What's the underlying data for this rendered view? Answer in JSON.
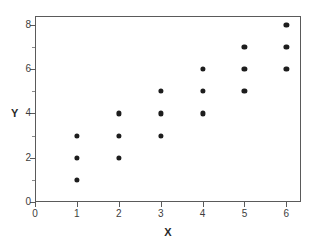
{
  "chart_data": {
    "type": "scatter",
    "title": "",
    "xlabel": "X",
    "ylabel": "Y",
    "xlim": [
      0,
      6.35
    ],
    "ylim": [
      0,
      8.4
    ],
    "grid": false,
    "legend": null,
    "x_ticks": [
      0,
      1,
      2,
      3,
      4,
      5,
      6
    ],
    "x_tick_labels": [
      "0",
      "1",
      "2",
      "3",
      "4",
      "5",
      "6"
    ],
    "y_ticks": [
      0,
      2,
      4,
      6,
      8
    ],
    "y_tick_labels": [
      "0",
      "2",
      "4",
      "6",
      "8"
    ],
    "y_minor_ticks": [
      1,
      3,
      5,
      7
    ],
    "marker": "filled-circle",
    "marker_color": "#1d1d1d",
    "points": [
      {
        "x": 1,
        "y": 1
      },
      {
        "x": 1,
        "y": 2
      },
      {
        "x": 1,
        "y": 3
      },
      {
        "x": 2,
        "y": 2
      },
      {
        "x": 2,
        "y": 3
      },
      {
        "x": 2,
        "y": 4
      },
      {
        "x": 3,
        "y": 3
      },
      {
        "x": 3,
        "y": 4
      },
      {
        "x": 3,
        "y": 5
      },
      {
        "x": 4,
        "y": 4
      },
      {
        "x": 4,
        "y": 5
      },
      {
        "x": 4,
        "y": 6
      },
      {
        "x": 5,
        "y": 5
      },
      {
        "x": 5,
        "y": 6
      },
      {
        "x": 5,
        "y": 7
      },
      {
        "x": 6,
        "y": 6
      },
      {
        "x": 6,
        "y": 7
      },
      {
        "x": 6,
        "y": 8
      }
    ]
  },
  "style": {
    "frame_color": "#5a5a5a",
    "background": "#ffffff",
    "text_color": "#3a3a3a"
  }
}
